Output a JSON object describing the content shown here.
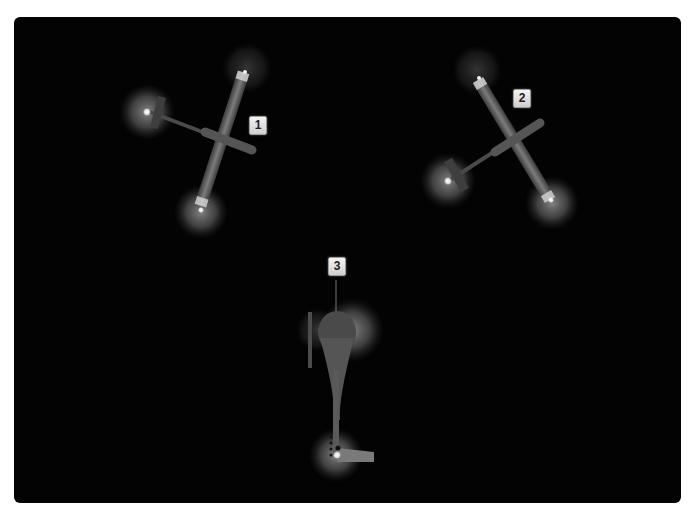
{
  "figure": {
    "background_color": "#030303",
    "aircraft": [
      {
        "id": 1,
        "label": "1",
        "orientation": "nose right-down, wing diagonal"
      },
      {
        "id": 2,
        "label": "2",
        "orientation": "nose right-up, wing diagonal"
      },
      {
        "id": 3,
        "label": "3",
        "orientation": "nose up, viewed from behind/above"
      }
    ]
  }
}
